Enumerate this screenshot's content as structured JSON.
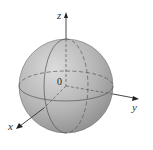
{
  "diagram": {
    "type": "sphere-with-3d-axes",
    "labels": {
      "z": "z",
      "y": "y",
      "x": "x",
      "origin": "0"
    },
    "colors": {
      "sphere_light": "#d8d8d8",
      "sphere_dark": "#8a8a8a",
      "axis": "#333333",
      "dashed": "#555555"
    }
  }
}
